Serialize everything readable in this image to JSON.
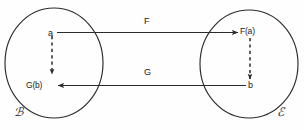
{
  "diagram": {
    "background_color": "#fefefe",
    "stroke_color": "#2b2b2b",
    "text_color": "#1a1a1a",
    "sets": [
      {
        "id": "domain-set",
        "label": "ℬ",
        "label_plain": "C",
        "cx": 54,
        "cy": 63,
        "r": 49
      },
      {
        "id": "codomain-set",
        "label": "ℰ",
        "label_plain": "D",
        "cx": 249,
        "cy": 64,
        "r": 49
      }
    ],
    "points": [
      {
        "id": "point-a",
        "label": "a",
        "x": 52,
        "y": 33
      },
      {
        "id": "point-fa",
        "label": "F(a)",
        "x": 250,
        "y": 32
      },
      {
        "id": "point-gb",
        "label": "G(b)",
        "x": 54,
        "y": 86
      },
      {
        "id": "point-b",
        "label": "b",
        "x": 250,
        "y": 86
      }
    ],
    "arrows": [
      {
        "id": "arrow-f",
        "label": "F",
        "label_x": 147,
        "label_y": 22,
        "style": "solid",
        "from": "a",
        "to": "F(a)",
        "direction": "right"
      },
      {
        "id": "arrow-g",
        "label": "G",
        "label_x": 147,
        "label_y": 73,
        "style": "solid",
        "from": "b",
        "to": "G(b)",
        "direction": "left"
      },
      {
        "id": "arrow-vertical-left",
        "label": "",
        "style": "dashed",
        "from": "a",
        "to": "G(b)",
        "direction": "down"
      },
      {
        "id": "arrow-vertical-right",
        "label": "",
        "style": "dashed",
        "from": "F(a)",
        "to": "b",
        "direction": "down"
      }
    ]
  }
}
